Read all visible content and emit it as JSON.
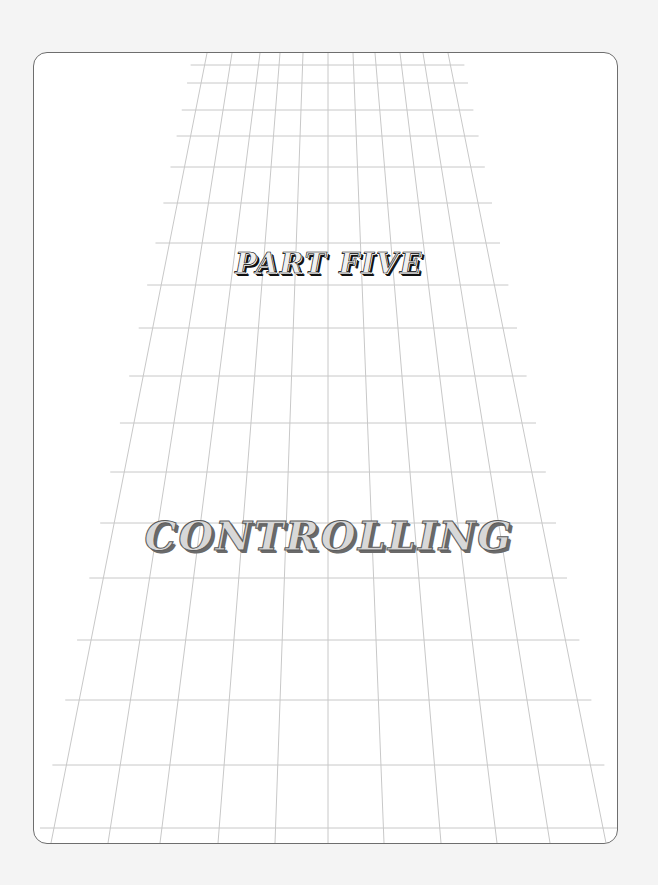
{
  "page": {
    "part_label": "PART FIVE",
    "section_title": "CONTROLLING"
  },
  "colors": {
    "background": "#f4f4f4",
    "page": "#ffffff",
    "frame_border": "#6e6e6e",
    "grid_line": "#c8c8c8",
    "part_label_shadow": "#111111",
    "section_title_shadow": "#6a6a6a"
  },
  "grid": {
    "horizontal_y": [
      65,
      83,
      110,
      136,
      167,
      203,
      243,
      285,
      328,
      376,
      423,
      472,
      523,
      578,
      640,
      700,
      765,
      828
    ],
    "vertical_top_x": [
      207,
      232,
      260,
      280,
      303,
      328,
      353,
      375,
      400,
      423,
      448
    ],
    "vertical_bottom_x": [
      51,
      108,
      160,
      218,
      275,
      328,
      384,
      441,
      497,
      550,
      606
    ]
  }
}
